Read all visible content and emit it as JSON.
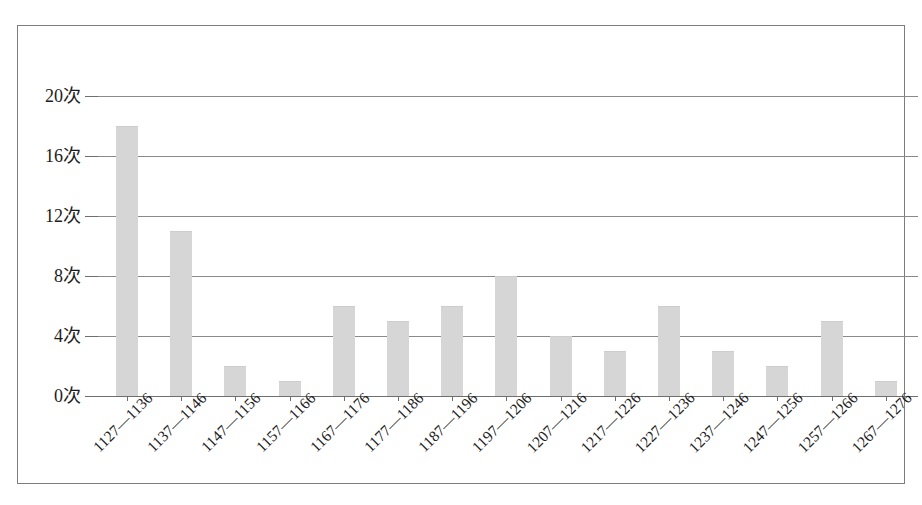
{
  "chart_data": {
    "type": "bar",
    "title": "",
    "subtitle": "",
    "xlabel": "",
    "ylabel": "",
    "categories": [
      "1127—1136",
      "1137—1146",
      "1147—1156",
      "1157—1166",
      "1167—1176",
      "1177—1186",
      "1187—1196",
      "1197—1206",
      "1207—1216",
      "1217—1226",
      "1227—1236",
      "1237—1246",
      "1247—1256",
      "1257—1266",
      "1267—1276"
    ],
    "values": [
      18,
      11,
      2,
      1,
      6,
      5,
      6,
      8,
      4,
      3,
      6,
      3,
      2,
      5,
      1
    ],
    "ylim": [
      0,
      20
    ],
    "ytick_values": [
      0,
      4,
      8,
      12,
      16,
      20
    ],
    "ytick_labels": [
      "0次",
      "4次",
      "8次",
      "12次",
      "16次",
      "20次"
    ],
    "y_unit": "次",
    "grid": true,
    "legend": false,
    "legend_position": "none",
    "bar_color": "#d6d6d6",
    "gridline_color": "#8a8a8a",
    "axis_color": "#6f6f6f",
    "frame_color": "#7d7d7d",
    "background_color": "#ffffff"
  }
}
